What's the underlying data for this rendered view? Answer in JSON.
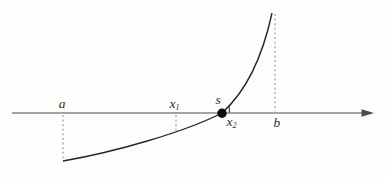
{
  "figure": {
    "labels": {
      "a": "a",
      "x1": {
        "base": "x",
        "sub": "1"
      },
      "s": "s",
      "x2": {
        "base": "x",
        "sub": "2"
      },
      "b": "b"
    },
    "colors": {
      "background": "#fdfdfc",
      "axis": "#4d4d4d",
      "curve": "#262626",
      "dashed": "#8c8c8c",
      "dot": "#0d0d0d",
      "label": "#2e2e2e"
    }
  }
}
